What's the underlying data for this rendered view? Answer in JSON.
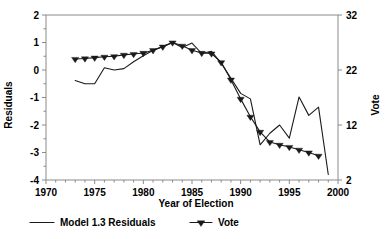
{
  "chart_data": {
    "type": "line",
    "title": "",
    "xlabel": "Year of Election",
    "ylabel": "Residuals",
    "y2label": "Vote",
    "xlim": [
      1970,
      2000
    ],
    "ylim": [
      -4,
      2
    ],
    "y2lim": [
      2,
      32
    ],
    "grid": false,
    "legend_position": "bottom",
    "x_ticks_major": [
      1970,
      1975,
      1980,
      1985,
      1990,
      1995,
      2000
    ],
    "x_tick_labels": [
      "1970",
      "1975",
      "1980",
      "1985",
      "1990",
      "1995",
      "2000"
    ],
    "x_ticks_minor": [
      1971,
      1972,
      1973,
      1974,
      1976,
      1977,
      1978,
      1979,
      1981,
      1982,
      1983,
      1984,
      1986,
      1987,
      1988,
      1989,
      1991,
      1992,
      1993,
      1994,
      1996,
      1997,
      1998,
      1999
    ],
    "y_ticks_major": [
      -4,
      -3,
      -2,
      -1,
      0,
      1,
      2
    ],
    "y_tick_labels": [
      "-4",
      "-3",
      "-2",
      "-1",
      "0",
      "1",
      "2"
    ],
    "y_ticks_minor": [
      -3.5,
      -2.5,
      -1.5,
      -0.5,
      0.5,
      1.5
    ],
    "y2_ticks_major": [
      2,
      12,
      22,
      32
    ],
    "y2_tick_labels": [
      "2",
      "12",
      "22",
      "32"
    ],
    "series": [
      {
        "name": "Model 1.3 Residuals",
        "axis": "left",
        "marker": "none",
        "x": [
          1973,
          1974,
          1975,
          1976,
          1977,
          1978,
          1979,
          1980,
          1981,
          1982,
          1983,
          1984,
          1985,
          1986,
          1987,
          1988,
          1989,
          1990,
          1991,
          1992,
          1993,
          1994,
          1995,
          1996,
          1997,
          1998,
          1999
        ],
        "values": [
          -0.38,
          -0.5,
          -0.5,
          0.08,
          0.0,
          0.05,
          0.3,
          0.52,
          0.72,
          0.85,
          1.0,
          0.82,
          0.98,
          0.6,
          0.68,
          0.25,
          -0.3,
          -0.85,
          -1.05,
          -2.72,
          -2.3,
          -2.0,
          -2.48,
          -0.98,
          -1.65,
          -1.35,
          -3.8
        ]
      },
      {
        "name": "Vote",
        "axis": "right",
        "marker": "triangle-down",
        "x": [
          1973,
          1974,
          1975,
          1976,
          1977,
          1978,
          1979,
          1980,
          1981,
          1982,
          1983,
          1984,
          1985,
          1986,
          1987,
          1988,
          1989,
          1990,
          1991,
          1992,
          1993,
          1994,
          1995,
          1996,
          1997,
          1998
        ],
        "values_left_scale": [
          0.4,
          0.42,
          0.45,
          0.48,
          0.5,
          0.55,
          0.58,
          0.62,
          0.72,
          0.85,
          1.0,
          0.88,
          0.72,
          0.62,
          0.6,
          0.28,
          -0.35,
          -1.05,
          -1.7,
          -2.25,
          -2.62,
          -2.72,
          -2.8,
          -2.9,
          -3.0,
          -3.12
        ],
        "values": [
          24.0,
          24.1,
          24.25,
          24.4,
          24.5,
          24.75,
          24.9,
          25.1,
          25.6,
          26.25,
          27.0,
          26.4,
          25.6,
          25.1,
          25.0,
          23.4,
          20.25,
          16.75,
          13.5,
          10.75,
          8.9,
          8.4,
          8.0,
          7.5,
          7.0,
          6.4
        ]
      }
    ],
    "legend": [
      {
        "label": "Model 1.3 Residuals",
        "style": "line"
      },
      {
        "label": "Vote",
        "style": "line-marker"
      }
    ],
    "colors": {
      "line": "#1a1a1a",
      "axis": "#8a8a8a",
      "background": "#ffffff"
    }
  }
}
